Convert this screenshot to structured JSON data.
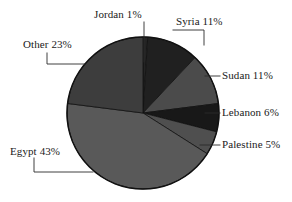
{
  "chart_data": {
    "type": "pie",
    "title": "",
    "subtitle": "",
    "xlabel": "",
    "ylabel": "",
    "legend_position": "none",
    "grid": false,
    "labels_style": "callout-leader-lines",
    "start_angle_deg": 0,
    "direction": "clockwise",
    "categories": [
      "Jordan",
      "Syria",
      "Sudan",
      "Lebanon",
      "Palestine",
      "Egypt",
      "Other"
    ],
    "values": [
      1,
      11,
      11,
      6,
      5,
      43,
      23
    ],
    "units": "percent",
    "slices": [
      {
        "name": "Jordan",
        "value": 1,
        "label": "Jordan 1%",
        "color": "#242424"
      },
      {
        "name": "Syria",
        "value": 11,
        "label": "Syria 11%",
        "color": "#202020"
      },
      {
        "name": "Sudan",
        "value": 11,
        "label": "Sudan 11%",
        "color": "#4b4b4b"
      },
      {
        "name": "Lebanon",
        "value": 6,
        "label": "Lebanon 6%",
        "color": "#181818"
      },
      {
        "name": "Palestine",
        "value": 5,
        "label": "Palestine 5%",
        "color": "#4f4f4f"
      },
      {
        "name": "Egypt",
        "value": 43,
        "label": "Egypt 43%",
        "color": "#595959"
      },
      {
        "name": "Other",
        "value": 23,
        "label": "Other 23%",
        "color": "#3d3d3d"
      }
    ]
  },
  "labels": {
    "jordan": "Jordan 1%",
    "syria": "Syria 11%",
    "sudan": "Sudan 11%",
    "lebanon": "Lebanon 6%",
    "palestine": "Palestine 5%",
    "egypt": "Egypt 43%",
    "other": "Other 23%"
  },
  "colors": {
    "background": "#ffffff",
    "outline": "#111111",
    "leader_line": "#2b2b2b",
    "text": "#1a1a1a"
  }
}
